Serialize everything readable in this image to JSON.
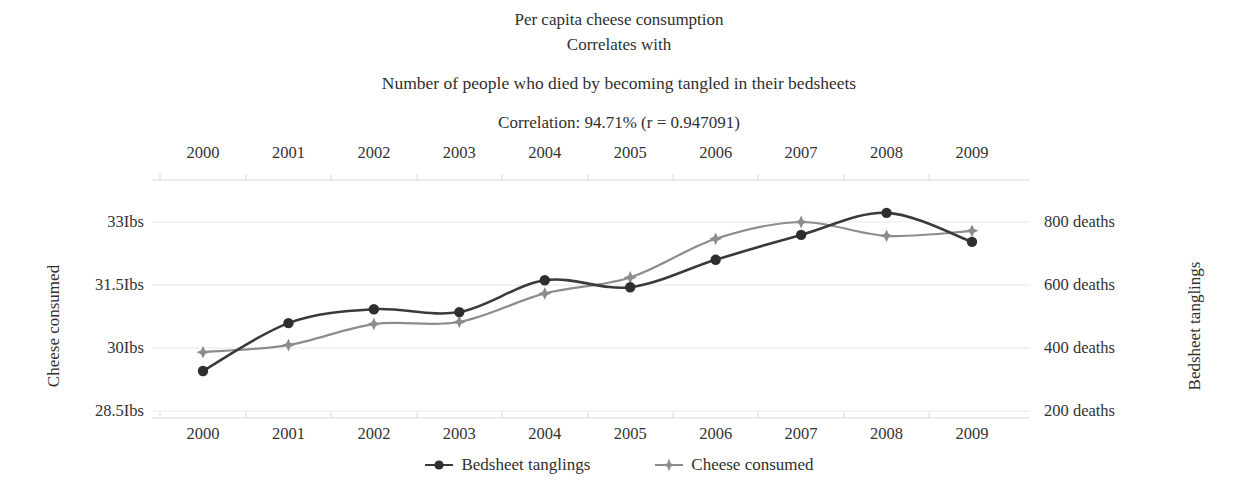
{
  "titles": {
    "line1": "Per capita cheese consumption",
    "line2": "Correlates with",
    "line3": "Number of people who died by becoming tangled in their bedsheets",
    "line4": "Correlation: 94.71% (r = 0.947091)"
  },
  "legend": [
    {
      "label": "Bedsheet tanglings",
      "marker": "filled-circle",
      "color": "#3a3a3a"
    },
    {
      "label": "Cheese consumed",
      "marker": "four-point-star",
      "color": "#8c8c8c"
    }
  ],
  "axes": {
    "left_title": "Cheese consumed",
    "right_title": "Bedsheet tanglings",
    "left_ticks": [
      "33Ibs",
      "31.5Ibs",
      "30Ibs",
      "28.5Ibs"
    ],
    "right_ticks": [
      "800 deaths",
      "600 deaths",
      "400 deaths",
      "200 deaths"
    ]
  },
  "chart_data": {
    "type": "line",
    "title": "Per capita cheese consumption Correlates with Number of people who died by becoming tangled in their bedsheets",
    "subtitle": "Correlation: 94.71% (r = 0.947091)",
    "correlation_percent": "94.71%",
    "correlation_r": "0.947091",
    "xlabel": "",
    "x": [
      2000,
      2001,
      2002,
      2003,
      2004,
      2005,
      2006,
      2007,
      2008,
      2009
    ],
    "xtick_labels": [
      "2000",
      "2001",
      "2002",
      "2003",
      "2004",
      "2005",
      "2006",
      "2007",
      "2008",
      "2009"
    ],
    "grid": true,
    "legend_position": "bottom",
    "series": [
      {
        "name": "Bedsheet tanglings",
        "axis": "right",
        "color": "#3a3a3a",
        "marker": "filled-circle",
        "unit": "deaths",
        "ylabel": "Bedsheet tanglings",
        "ylim": [
          200,
          800
        ],
        "ytick_values": [
          800,
          600,
          400,
          200
        ],
        "ytick_labels": [
          "800 deaths",
          "600 deaths",
          "400 deaths",
          "200 deaths"
        ],
        "values": [
          327,
          479,
          523,
          514,
          615,
          593,
          680,
          759,
          829,
          737
        ]
      },
      {
        "name": "Cheese consumed",
        "axis": "left",
        "color": "#8c8c8c",
        "marker": "four-point-star",
        "unit": "Ibs",
        "ylabel": "Cheese consumed",
        "ylim": [
          28.5,
          33
        ],
        "ytick_values": [
          33,
          31.5,
          30,
          28.5
        ],
        "ytick_labels": [
          "33Ibs",
          "31.5Ibs",
          "30Ibs",
          "28.5Ibs"
        ],
        "values": [
          29.9,
          30.07,
          30.57,
          30.62,
          31.3,
          31.68,
          32.6,
          33.0,
          32.67,
          32.79
        ]
      }
    ]
  }
}
